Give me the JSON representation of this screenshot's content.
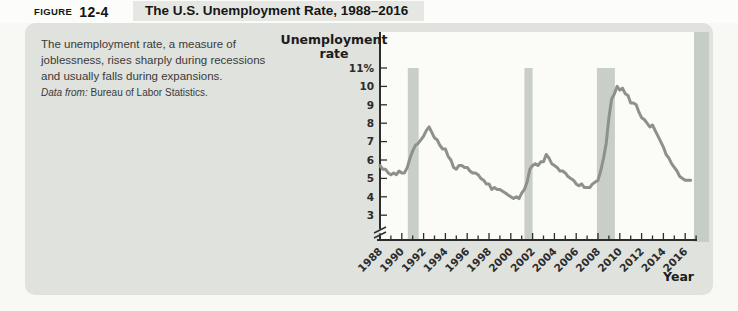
{
  "figure": {
    "label_word": "FIGURE",
    "label_num": "12-4",
    "title": "The U.S. Unemployment Rate, 1988–2016"
  },
  "caption": {
    "lines": [
      "The unemployment rate, a measure of",
      "joblessness, rises sharply during recessions",
      "and usually falls during expansions."
    ],
    "source_label": "Data from:",
    "source_text": "Bureau of Labor Statistics."
  },
  "theme": {
    "page_bg": "#f8f8f5",
    "header_bg": "#fcfcfa",
    "title_strip_bg": "#e6e7e3",
    "panel_bg": "#e0e2dd",
    "plot_bg": "#fbfbf8",
    "recession_band": "#c9cec8",
    "edge_band": "#c6ccc6",
    "line": "#8d908c",
    "axis": "#2c2c2c",
    "text": "#3a3a3a"
  },
  "chart_data": {
    "type": "line",
    "title": "The U.S. Unemployment Rate, 1988–2016",
    "xlabel": "Year",
    "ylabel": "Unemployment rate",
    "ylabel_lines": [
      "Unemployment",
      "rate"
    ],
    "xlim": [
      1988,
      2017
    ],
    "ylim_shown": [
      3,
      11
    ],
    "axis_break": true,
    "grid": false,
    "y_ticks": [
      {
        "v": 11,
        "label": "11%"
      },
      {
        "v": 10,
        "label": "10"
      },
      {
        "v": 9,
        "label": "9"
      },
      {
        "v": 8,
        "label": "8"
      },
      {
        "v": 7,
        "label": "7"
      },
      {
        "v": 6,
        "label": "6"
      },
      {
        "v": 5,
        "label": "5"
      },
      {
        "v": 4,
        "label": "4"
      },
      {
        "v": 3,
        "label": "3"
      }
    ],
    "x_tick_labels": [
      1988,
      1990,
      1992,
      1994,
      1996,
      1998,
      2000,
      2002,
      2004,
      2006,
      2008,
      2010,
      2012,
      2014,
      2016
    ],
    "x_minor_ticks_every_year": true,
    "recessions": [
      {
        "start": 1990.55,
        "end": 1991.55
      },
      {
        "start": 2001.25,
        "end": 2002.0
      },
      {
        "start": 2007.9,
        "end": 2009.55
      }
    ],
    "series": [
      {
        "name": "Unemployment rate (%)",
        "points": [
          [
            1988.0,
            5.7
          ],
          [
            1988.25,
            5.5
          ],
          [
            1988.5,
            5.5
          ],
          [
            1988.75,
            5.3
          ],
          [
            1989.0,
            5.2
          ],
          [
            1989.25,
            5.3
          ],
          [
            1989.5,
            5.2
          ],
          [
            1989.75,
            5.4
          ],
          [
            1990.0,
            5.3
          ],
          [
            1990.25,
            5.3
          ],
          [
            1990.5,
            5.6
          ],
          [
            1990.75,
            6.1
          ],
          [
            1991.0,
            6.5
          ],
          [
            1991.25,
            6.8
          ],
          [
            1991.5,
            6.9
          ],
          [
            1991.75,
            7.1
          ],
          [
            1992.0,
            7.3
          ],
          [
            1992.25,
            7.6
          ],
          [
            1992.5,
            7.8
          ],
          [
            1992.75,
            7.5
          ],
          [
            1993.0,
            7.2
          ],
          [
            1993.25,
            7.1
          ],
          [
            1993.5,
            6.8
          ],
          [
            1993.75,
            6.6
          ],
          [
            1994.0,
            6.6
          ],
          [
            1994.25,
            6.2
          ],
          [
            1994.5,
            6.0
          ],
          [
            1994.75,
            5.6
          ],
          [
            1995.0,
            5.5
          ],
          [
            1995.25,
            5.7
          ],
          [
            1995.5,
            5.7
          ],
          [
            1995.75,
            5.6
          ],
          [
            1996.0,
            5.6
          ],
          [
            1996.25,
            5.4
          ],
          [
            1996.5,
            5.3
          ],
          [
            1996.75,
            5.3
          ],
          [
            1997.0,
            5.2
          ],
          [
            1997.25,
            5.0
          ],
          [
            1997.5,
            4.9
          ],
          [
            1997.75,
            4.7
          ],
          [
            1998.0,
            4.7
          ],
          [
            1998.25,
            4.4
          ],
          [
            1998.5,
            4.5
          ],
          [
            1998.75,
            4.4
          ],
          [
            1999.0,
            4.4
          ],
          [
            1999.25,
            4.3
          ],
          [
            1999.5,
            4.2
          ],
          [
            1999.75,
            4.1
          ],
          [
            2000.0,
            4.0
          ],
          [
            2000.25,
            3.9
          ],
          [
            2000.5,
            4.0
          ],
          [
            2000.75,
            3.9
          ],
          [
            2001.0,
            4.2
          ],
          [
            2001.25,
            4.4
          ],
          [
            2001.5,
            4.8
          ],
          [
            2001.75,
            5.5
          ],
          [
            2002.0,
            5.7
          ],
          [
            2002.25,
            5.8
          ],
          [
            2002.5,
            5.7
          ],
          [
            2002.75,
            5.9
          ],
          [
            2003.0,
            5.9
          ],
          [
            2003.25,
            6.3
          ],
          [
            2003.5,
            6.1
          ],
          [
            2003.75,
            5.8
          ],
          [
            2004.0,
            5.7
          ],
          [
            2004.25,
            5.6
          ],
          [
            2004.5,
            5.4
          ],
          [
            2004.75,
            5.4
          ],
          [
            2005.0,
            5.3
          ],
          [
            2005.25,
            5.1
          ],
          [
            2005.5,
            5.0
          ],
          [
            2005.75,
            4.9
          ],
          [
            2006.0,
            4.7
          ],
          [
            2006.25,
            4.6
          ],
          [
            2006.5,
            4.7
          ],
          [
            2006.75,
            4.5
          ],
          [
            2007.0,
            4.5
          ],
          [
            2007.25,
            4.5
          ],
          [
            2007.5,
            4.7
          ],
          [
            2007.75,
            4.8
          ],
          [
            2008.0,
            4.9
          ],
          [
            2008.25,
            5.4
          ],
          [
            2008.5,
            6.1
          ],
          [
            2008.75,
            6.9
          ],
          [
            2009.0,
            8.3
          ],
          [
            2009.25,
            9.3
          ],
          [
            2009.5,
            9.6
          ],
          [
            2009.75,
            10.0
          ],
          [
            2010.0,
            9.8
          ],
          [
            2010.25,
            9.9
          ],
          [
            2010.5,
            9.6
          ],
          [
            2010.75,
            9.5
          ],
          [
            2011.0,
            9.1
          ],
          [
            2011.25,
            9.1
          ],
          [
            2011.5,
            9.0
          ],
          [
            2011.75,
            8.6
          ],
          [
            2012.0,
            8.3
          ],
          [
            2012.25,
            8.2
          ],
          [
            2012.5,
            8.0
          ],
          [
            2012.75,
            7.8
          ],
          [
            2013.0,
            7.9
          ],
          [
            2013.25,
            7.6
          ],
          [
            2013.5,
            7.3
          ],
          [
            2013.75,
            7.0
          ],
          [
            2014.0,
            6.7
          ],
          [
            2014.25,
            6.3
          ],
          [
            2014.5,
            6.1
          ],
          [
            2014.75,
            5.8
          ],
          [
            2015.0,
            5.6
          ],
          [
            2015.25,
            5.4
          ],
          [
            2015.5,
            5.1
          ],
          [
            2015.75,
            5.0
          ],
          [
            2016.0,
            4.9
          ],
          [
            2016.25,
            4.9
          ],
          [
            2016.5,
            4.9
          ]
        ]
      }
    ]
  }
}
